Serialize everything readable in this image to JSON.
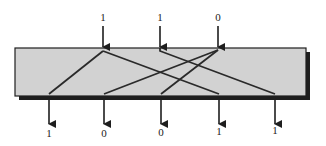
{
  "diagram": {
    "type": "wiring / routing network",
    "colors": {
      "box_fill": "#d2d2d2",
      "box_border": "#1e1e1e",
      "line": "#2a2a2a",
      "background": "#ffffff"
    },
    "box": {
      "x": 15,
      "y": 48,
      "width": 291,
      "height": 48
    },
    "inputs": [
      {
        "id": "in1",
        "label": "1",
        "x": 103
      },
      {
        "id": "in2",
        "label": "1",
        "x": 160
      },
      {
        "id": "in3",
        "label": "0",
        "x": 218
      }
    ],
    "outputs": [
      {
        "id": "out1",
        "label": "1",
        "x": 49
      },
      {
        "id": "out2",
        "label": "0",
        "x": 104
      },
      {
        "id": "out3",
        "label": "0",
        "x": 161
      },
      {
        "id": "out4",
        "label": "1",
        "x": 219
      },
      {
        "id": "out5",
        "label": "1",
        "x": 275
      }
    ],
    "connections": [
      {
        "from": "in1",
        "to": "out1"
      },
      {
        "from": "in1",
        "to": "out4"
      },
      {
        "from": "in2",
        "to": "out5"
      },
      {
        "from": "in3",
        "to": "out2"
      },
      {
        "from": "in3",
        "to": "out3"
      }
    ]
  }
}
